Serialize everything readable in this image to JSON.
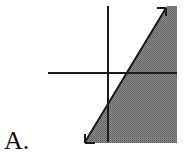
{
  "figure": {
    "option_label": "A.",
    "colors": {
      "shade": "#7a7a7a",
      "axes": "#1a1a1a",
      "boundary": "#1a1a1a",
      "background": "#ffffff"
    },
    "boundary": {
      "style": "solid",
      "arrows": "both ends",
      "slope_sign": "positive"
    },
    "shaded_side": "right"
  }
}
